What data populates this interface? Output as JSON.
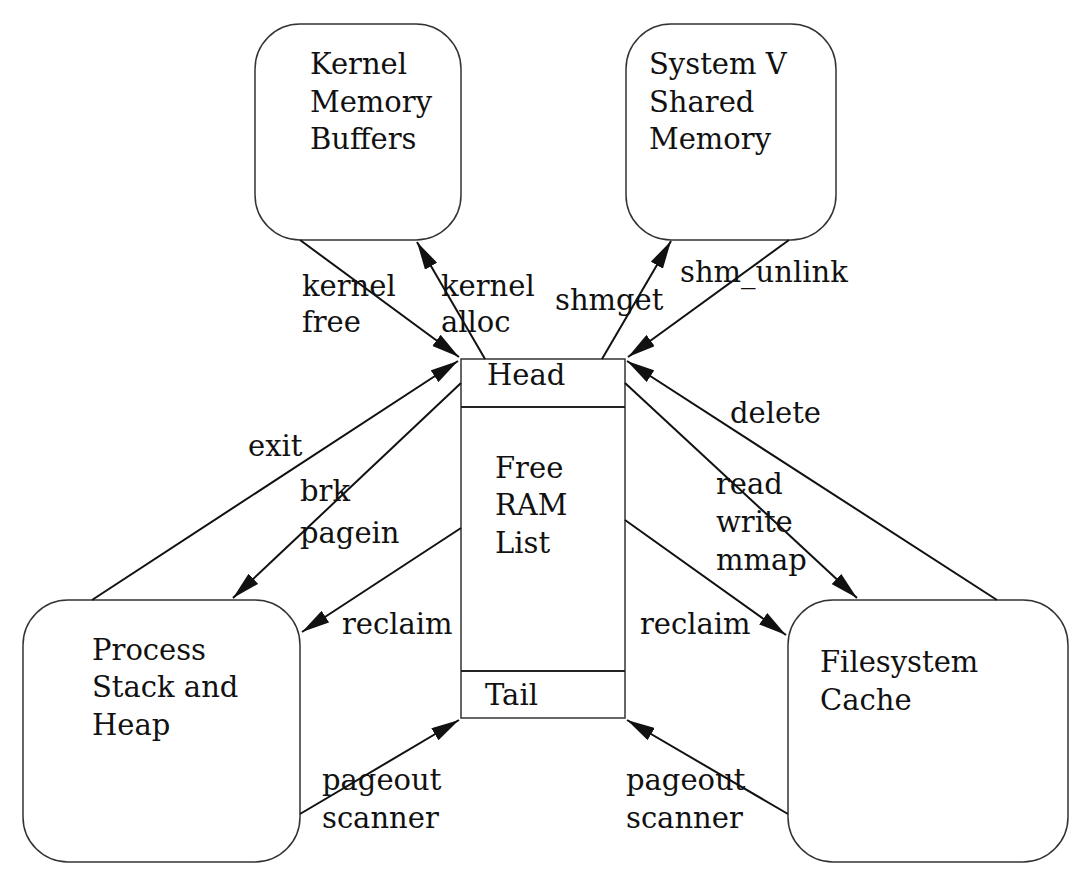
{
  "diagram": {
    "nodes": {
      "kernel": {
        "lines": [
          "Kernel",
          "Memory",
          "Buffers"
        ]
      },
      "shm": {
        "lines": [
          "System V",
          "Shared",
          "Memory"
        ]
      },
      "process": {
        "lines": [
          "Process",
          "Stack and",
          "Heap"
        ]
      },
      "fscache": {
        "lines": [
          "Filesystem",
          "Cache"
        ]
      },
      "freelist": {
        "head": "Head",
        "body": [
          "Free",
          "RAM",
          "List"
        ],
        "tail": "Tail"
      }
    },
    "edges": {
      "kernel_free": {
        "lines": [
          "kernel",
          "free"
        ],
        "from": "Kernel Memory Buffers",
        "to": "Head"
      },
      "kernel_alloc": {
        "lines": [
          "kernel",
          "alloc"
        ],
        "from": "Head",
        "to": "Kernel Memory Buffers"
      },
      "shmget": {
        "lines": [
          "shmget"
        ],
        "from": "Head",
        "to": "System V Shared Memory"
      },
      "shm_unlink": {
        "lines": [
          "shm_unlink"
        ],
        "from": "System V Shared Memory",
        "to": "Head"
      },
      "exit": {
        "lines": [
          "exit"
        ],
        "from": "Process Stack and Heap",
        "to": "Head"
      },
      "brk_pagein": {
        "lines": [
          "brk",
          "pagein"
        ],
        "from": "Head",
        "to": "Process Stack and Heap"
      },
      "reclaim_left": {
        "lines": [
          "reclaim"
        ],
        "from": "Free RAM List",
        "to": "Process Stack and Heap"
      },
      "pageout_left": {
        "lines": [
          "pageout",
          "scanner"
        ],
        "from": "Process Stack and Heap",
        "to": "Tail"
      },
      "delete": {
        "lines": [
          "delete"
        ],
        "from": "Filesystem Cache",
        "to": "Head"
      },
      "read_write_mmap": {
        "lines": [
          "read",
          "write",
          "mmap"
        ],
        "from": "Head",
        "to": "Filesystem Cache"
      },
      "reclaim_right": {
        "lines": [
          "reclaim"
        ],
        "from": "Free RAM List",
        "to": "Filesystem Cache"
      },
      "pageout_right": {
        "lines": [
          "pageout",
          "scanner"
        ],
        "from": "Filesystem Cache",
        "to": "Tail"
      }
    }
  }
}
